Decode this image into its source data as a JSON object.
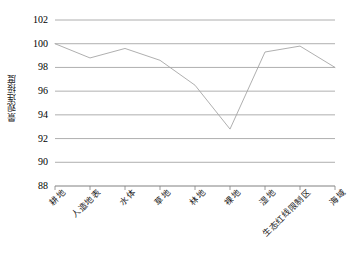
{
  "chart_data": {
    "type": "line",
    "title": "",
    "xlabel": "",
    "ylabel": "景观连接度",
    "ylim": [
      88,
      102
    ],
    "yticks": [
      88,
      90,
      92,
      94,
      96,
      98,
      100,
      102
    ],
    "grid": true,
    "legend": "none",
    "line_color": "#a6a6a6",
    "categories": [
      "耕地",
      "人造地表",
      "水体",
      "草地",
      "林地",
      "裸地",
      "湿地",
      "生态红线限制区",
      "海域"
    ],
    "values": [
      100.0,
      98.8,
      99.6,
      98.6,
      96.5,
      92.8,
      99.3,
      99.8,
      98.0
    ],
    "series": [
      {
        "name": "景观连接度",
        "values": [
          100.0,
          98.8,
          99.6,
          98.6,
          96.5,
          92.8,
          99.3,
          99.8,
          98.0
        ]
      }
    ]
  },
  "axes": {
    "y_title": "景观连接度",
    "y_tick_labels": [
      "102",
      "100",
      "98",
      "96",
      "94",
      "92",
      "90",
      "88"
    ]
  }
}
